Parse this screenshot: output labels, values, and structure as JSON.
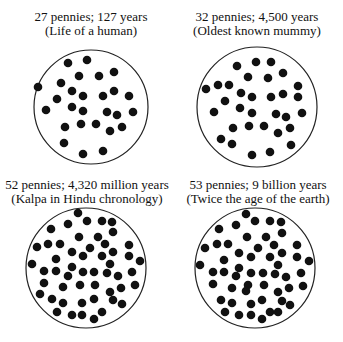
{
  "panels": [
    {
      "line1": "27 pennies; 127 years",
      "line2": "(Life of a human)",
      "caption_pos": [
        91,
        10
      ],
      "circle": {
        "cx": 91,
        "cy": 107,
        "r": 57
      },
      "dots": [
        [
          68,
          63
        ],
        [
          87,
          60
        ],
        [
          79,
          76
        ],
        [
          99,
          76
        ],
        [
          114,
          72
        ],
        [
          38,
          87
        ],
        [
          61,
          83
        ],
        [
          72,
          91
        ],
        [
          83,
          96
        ],
        [
          103,
          96
        ],
        [
          114,
          91
        ],
        [
          129,
          96
        ],
        [
          57,
          99
        ],
        [
          46,
          110
        ],
        [
          72,
          107
        ],
        [
          83,
          111
        ],
        [
          107,
          112
        ],
        [
          117,
          115
        ],
        [
          133,
          112
        ],
        [
          65,
          127
        ],
        [
          81,
          124
        ],
        [
          96,
          124
        ],
        [
          110,
          131
        ],
        [
          122,
          127
        ],
        [
          64,
          143
        ],
        [
          83,
          154
        ],
        [
          103,
          151
        ]
      ]
    },
    {
      "line1": "32 pennies; 4,500 years",
      "line2": "(Oldest known mummy)",
      "caption_pos": [
        257,
        10
      ],
      "circle": {
        "cx": 257,
        "cy": 107,
        "r": 60
      },
      "dots": [
        [
          237,
          66
        ],
        [
          256,
          62
        ],
        [
          271,
          62
        ],
        [
          248,
          77
        ],
        [
          268,
          78
        ],
        [
          283,
          73
        ],
        [
          206,
          89
        ],
        [
          218,
          85
        ],
        [
          229,
          85
        ],
        [
          241,
          93
        ],
        [
          252,
          97
        ],
        [
          271,
          97
        ],
        [
          283,
          94
        ],
        [
          298,
          86
        ],
        [
          298,
          97
        ],
        [
          225,
          101
        ],
        [
          214,
          112
        ],
        [
          240,
          108
        ],
        [
          252,
          113
        ],
        [
          276,
          114
        ],
        [
          286,
          117
        ],
        [
          302,
          113
        ],
        [
          233,
          128
        ],
        [
          249,
          126
        ],
        [
          264,
          126
        ],
        [
          278,
          133
        ],
        [
          290,
          128
        ],
        [
          221,
          139
        ],
        [
          232,
          144
        ],
        [
          291,
          145
        ],
        [
          252,
          155
        ],
        [
          270,
          152
        ]
      ]
    },
    {
      "line1": "52 pennies; 4,320 million years",
      "line2": "(Kalpa in Hindu chronology)",
      "caption_pos": [
        87,
        178
      ],
      "circle": {
        "cx": 86,
        "cy": 268,
        "r": 60
      },
      "dots": [
        [
          78,
          213
        ],
        [
          87,
          221
        ],
        [
          102,
          221
        ],
        [
          112,
          222
        ],
        [
          68,
          224
        ],
        [
          51,
          229
        ],
        [
          113,
          232
        ],
        [
          79,
          237
        ],
        [
          98,
          237
        ],
        [
          37,
          247
        ],
        [
          48,
          244
        ],
        [
          60,
          244
        ],
        [
          90,
          248
        ],
        [
          105,
          244
        ],
        [
          129,
          245
        ],
        [
          72,
          252
        ],
        [
          83,
          256
        ],
        [
          102,
          256
        ],
        [
          113,
          252
        ],
        [
          129,
          256
        ],
        [
          140,
          261
        ],
        [
          56,
          259
        ],
        [
          32,
          264
        ],
        [
          110,
          264
        ],
        [
          72,
          267
        ],
        [
          44,
          271
        ],
        [
          56,
          271
        ],
        [
          68,
          276
        ],
        [
          83,
          272
        ],
        [
          94,
          272
        ],
        [
          107,
          273
        ],
        [
          118,
          276
        ],
        [
          132,
          272
        ],
        [
          44,
          283
        ],
        [
          63,
          287
        ],
        [
          80,
          285
        ],
        [
          95,
          285
        ],
        [
          121,
          288
        ],
        [
          135,
          285
        ],
        [
          40,
          294
        ],
        [
          110,
          292
        ],
        [
          52,
          299
        ],
        [
          63,
          303
        ],
        [
          82,
          303
        ],
        [
          94,
          299
        ],
        [
          113,
          300
        ],
        [
          122,
          304
        ],
        [
          57,
          312
        ],
        [
          72,
          315
        ],
        [
          82,
          315
        ],
        [
          102,
          312
        ],
        [
          94,
          319
        ]
      ]
    },
    {
      "line1": "53 pennies; 9 billion years",
      "line2": "(Twice the age of the earth)",
      "caption_pos": [
        258,
        178
      ],
      "circle": {
        "cx": 255,
        "cy": 268,
        "r": 60
      },
      "dots": [
        [
          246,
          214
        ],
        [
          255,
          221
        ],
        [
          270,
          221
        ],
        [
          281,
          222
        ],
        [
          236,
          225
        ],
        [
          219,
          229
        ],
        [
          282,
          233
        ],
        [
          247,
          237
        ],
        [
          266,
          237
        ],
        [
          205,
          248
        ],
        [
          217,
          244
        ],
        [
          228,
          244
        ],
        [
          258,
          248
        ],
        [
          274,
          245
        ],
        [
          297,
          245
        ],
        [
          239,
          253
        ],
        [
          251,
          257
        ],
        [
          270,
          257
        ],
        [
          282,
          253
        ],
        [
          297,
          257
        ],
        [
          309,
          261
        ],
        [
          224,
          260
        ],
        [
          200,
          265
        ],
        [
          278,
          265
        ],
        [
          239,
          268
        ],
        [
          213,
          272
        ],
        [
          224,
          272
        ],
        [
          236,
          276
        ],
        [
          251,
          273
        ],
        [
          263,
          273
        ],
        [
          275,
          274
        ],
        [
          286,
          277
        ],
        [
          301,
          273
        ],
        [
          213,
          284
        ],
        [
          232,
          288
        ],
        [
          248,
          285
        ],
        [
          264,
          285
        ],
        [
          289,
          288
        ],
        [
          303,
          286
        ],
        [
          278,
          292
        ],
        [
          221,
          300
        ],
        [
          232,
          303
        ],
        [
          251,
          304
        ],
        [
          262,
          300
        ],
        [
          282,
          301
        ],
        [
          290,
          305
        ],
        [
          225,
          312
        ],
        [
          239,
          315
        ],
        [
          251,
          315
        ],
        [
          270,
          312
        ],
        [
          278,
          312
        ],
        [
          262,
          319
        ],
        [
          246,
          291
        ]
      ]
    }
  ],
  "colors": {
    "dot": "#111111",
    "outline": "#222222",
    "text": "#111111"
  }
}
